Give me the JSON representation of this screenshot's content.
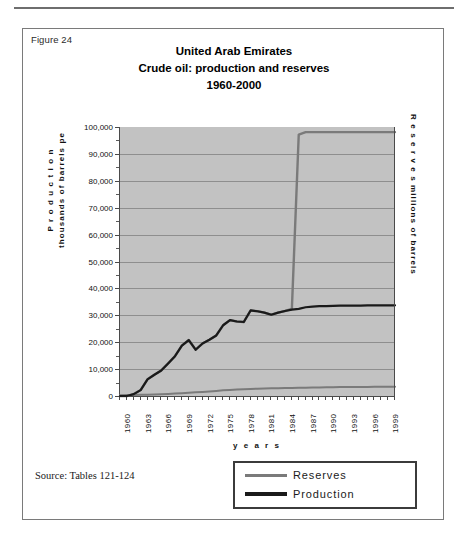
{
  "figure": {
    "label": "Figure 24",
    "source": "Source: Tables 121-124"
  },
  "chart_data": {
    "type": "line",
    "title": "United Arab Emirates",
    "title_line2": "Crude oil: production and reserves",
    "title_line3": "1960-2000",
    "xlabel": "y e a r s",
    "ylabel_left_line1": "P r o d u c t i o n",
    "ylabel_left_line2": "thousands of barrels pe",
    "ylabel_right_line1": "R e s e r v e s",
    "ylabel_right_line2": "millions of barrels",
    "ylim": [
      0,
      100000
    ],
    "ytick_labels": [
      "100,000",
      "90,000",
      "80,000",
      "70,000",
      "60,000",
      "50,000",
      "40,000",
      "30,000",
      "20,000",
      "10,000",
      "0"
    ],
    "ytick_values": [
      100000,
      90000,
      80000,
      70000,
      60000,
      50000,
      40000,
      30000,
      20000,
      10000,
      0
    ],
    "grid": true,
    "legend_position": "below-right",
    "xlim": [
      1960,
      2000
    ],
    "xtick_labels": [
      "1960",
      "1963",
      "1966",
      "1969",
      "1972",
      "1975",
      "1978",
      "1981",
      "1984",
      "1987",
      "1990",
      "1993",
      "1996",
      "1999"
    ],
    "xtick_values": [
      1960,
      1963,
      1966,
      1969,
      1972,
      1975,
      1978,
      1981,
      1984,
      1987,
      1990,
      1993,
      1996,
      1999
    ],
    "x": [
      1960,
      1961,
      1962,
      1963,
      1964,
      1965,
      1966,
      1967,
      1968,
      1969,
      1970,
      1971,
      1972,
      1973,
      1974,
      1975,
      1976,
      1977,
      1978,
      1979,
      1980,
      1981,
      1982,
      1983,
      1984,
      1985,
      1986,
      1987,
      1988,
      1989,
      1990,
      1991,
      1992,
      1993,
      1994,
      1995,
      1996,
      1997,
      1998,
      1999,
      2000
    ],
    "series": [
      {
        "name": "Production",
        "color": "#1a1a1a",
        "values": [
          0,
          0,
          700,
          2200,
          6200,
          7900,
          9500,
          12100,
          14800,
          18700,
          20800,
          17200,
          19500,
          20900,
          22500,
          26300,
          28200,
          27700,
          27500,
          31800,
          31500,
          31000,
          30200,
          31000,
          31600,
          32100,
          32400,
          33000,
          33200,
          33400,
          33400,
          33500,
          33600,
          33600,
          33600,
          33600,
          33700,
          33700,
          33700,
          33700,
          33700
        ]
      },
      {
        "name": "Reserves",
        "color": "#7a7a7a",
        "values": [
          0,
          0,
          700,
          2200,
          6200,
          7900,
          9500,
          12100,
          14800,
          18700,
          20800,
          17200,
          19500,
          20900,
          22500,
          26300,
          28200,
          27700,
          27500,
          31800,
          31500,
          31000,
          30200,
          31000,
          31600,
          32400,
          97200,
          98100,
          98100,
          98100,
          98100,
          98100,
          98100,
          98100,
          98100,
          98100,
          98100,
          98100,
          98100,
          98100,
          98100
        ]
      }
    ],
    "reserves_baseline": [
      300,
      350,
      400,
      450,
      500,
      550,
      650,
      750,
      900,
      1050,
      1200,
      1350,
      1500,
      1700,
      1900,
      2100,
      2250,
      2400,
      2500,
      2600,
      2700,
      2800,
      2850,
      2900,
      2950,
      3000,
      3050,
      3100,
      3150,
      3200,
      3250,
      3280,
      3300,
      3320,
      3340,
      3360,
      3380,
      3400,
      3420,
      3440,
      3460
    ],
    "legend": [
      {
        "name": "Reserves",
        "color": "#7a7a7a"
      },
      {
        "name": "Production",
        "color": "#1a1a1a"
      }
    ]
  }
}
